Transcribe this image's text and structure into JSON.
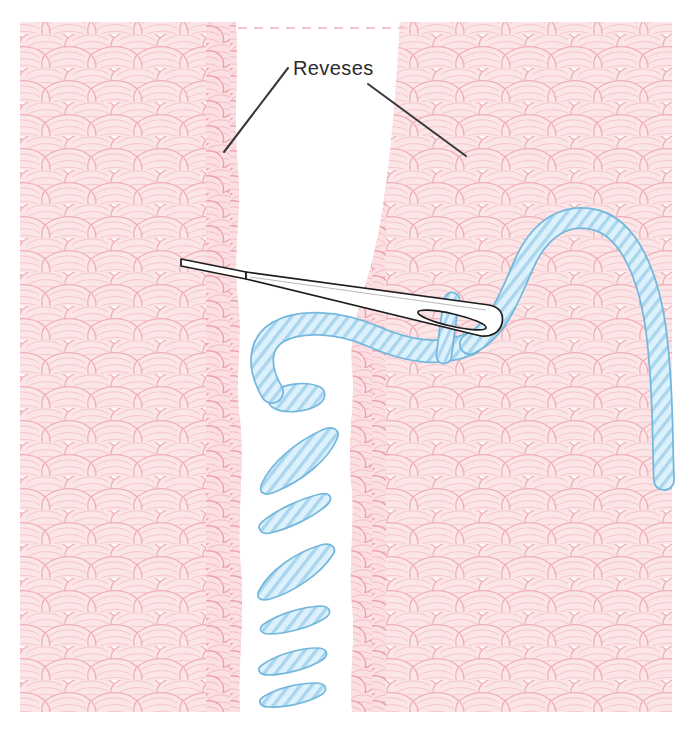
{
  "illustration": {
    "title": "Seaming two knitted panels with a tapestry needle",
    "subject": "knitting-mattress-stitch-diagram",
    "canvas": {
      "width": 699,
      "height": 734,
      "background": "#ffffff"
    }
  },
  "annotations": [
    {
      "id": "reveses",
      "label": "Reveses",
      "text_x": 291,
      "text_y": 75,
      "color": "#2b2b2b",
      "leaders": [
        {
          "name": "leader-left",
          "x1": 288,
          "y1": 68,
          "x2": 224,
          "y2": 152
        },
        {
          "name": "leader-right",
          "x1": 368,
          "y1": 84,
          "x2": 466,
          "y2": 156
        }
      ]
    }
  ],
  "fabric": {
    "name": "knitted-fabric",
    "yarn_color": "#efa0ab",
    "yarn_fill": "#fbdfe2",
    "yarn_fill_light": "#fdeef0",
    "left_panel": {
      "name": "left-knit-panel",
      "x": 20,
      "y": 22,
      "width": 220,
      "height": 690
    },
    "right_panel": {
      "name": "right-knit-panel",
      "x": 390,
      "y": 22,
      "width": 282,
      "height": 690
    },
    "gap": {
      "name": "seam-gap",
      "description": "white V-shaped opening between the two panels",
      "top_width": 170,
      "dashed_top_line_color": "#f0bcc2"
    },
    "selvedge_label": "reveses"
  },
  "needle": {
    "name": "tapestry-needle",
    "outline_color": "#1d1d1d",
    "body_color": "#ffffff",
    "tip": {
      "x": 181,
      "y": 260
    },
    "eye_end": {
      "x": 500,
      "y": 336
    },
    "eye": {
      "cx": 452,
      "cy": 320,
      "length": 72,
      "width": 13
    }
  },
  "yarn": {
    "name": "seaming-yarn",
    "outline_color": "#74b7dc",
    "fill_color": "#d6eefb",
    "stripe_color": "#9fd2ec",
    "stitch_count": 8,
    "stitches": [
      {
        "name": "seam-stitch-1",
        "cx": 296,
        "cy": 410,
        "angle": -28,
        "length": 52
      },
      {
        "name": "seam-stitch-2",
        "cx": 296,
        "cy": 470,
        "angle": -24,
        "length": 70
      },
      {
        "name": "seam-stitch-3",
        "cx": 296,
        "cy": 520,
        "angle": -16,
        "length": 58
      },
      {
        "name": "seam-stitch-4",
        "cx": 296,
        "cy": 566,
        "angle": -18,
        "length": 74
      },
      {
        "name": "seam-stitch-5",
        "cx": 293,
        "cy": 614,
        "angle": -8,
        "length": 62
      },
      {
        "name": "seam-stitch-6",
        "cx": 290,
        "cy": 652,
        "angle": -4,
        "length": 62
      },
      {
        "name": "seam-stitch-7",
        "cx": 290,
        "cy": 688,
        "angle": -2,
        "length": 60
      }
    ]
  },
  "palette": {
    "background": "#ffffff",
    "knit_pink_line": "#eba0aa",
    "knit_pink_fill": "#fbdfe2",
    "yarn_blue_line": "#74b7dc",
    "yarn_blue_fill": "#d6eefb",
    "needle_dark": "#1d1d1d",
    "text_dark": "#2b2b2b"
  }
}
